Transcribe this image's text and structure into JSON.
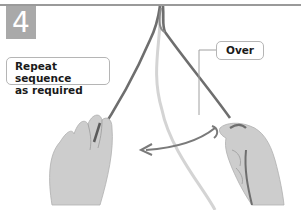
{
  "step": {
    "number": "4"
  },
  "callouts": {
    "repeat": {
      "line1": "Repeat sequence",
      "line2": "as required"
    },
    "over": {
      "label": "Over"
    }
  },
  "illustration": {
    "subject": "two hands holding cords forming a knot",
    "arrow_direction": "left",
    "colors": {
      "badge": "#a9a9a9",
      "rule": "#9a9a9a",
      "cord_dark": "#6e6e6e",
      "cord_light": "#d4d4d4",
      "skin": "#c9c9c9",
      "arrow": "#7a7a7a"
    }
  }
}
